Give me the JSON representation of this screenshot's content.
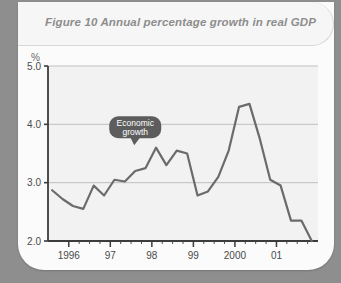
{
  "figure": {
    "title": "Figure 10  Annual percentage growth in real GDP",
    "unit_label": "%",
    "annotation": {
      "line1": "Economic",
      "line2": "growth"
    }
  },
  "colors": {
    "page_background": "#8e8e8e",
    "card_background": "#fbfbfb",
    "title_band": "#f6f6f6",
    "title_text": "#8d8d8d",
    "plot_background": "#f2f2f2",
    "gridline": "#b4b4b4",
    "axis": "#3c3c3c",
    "series_line": "#6b6b6b",
    "callout_fill": "#5d5d5d",
    "callout_text": "#ffffff",
    "tick_text": "#4a4a4a"
  },
  "chart_data": {
    "type": "line",
    "title": "Figure 10  Annual percentage growth in real GDP",
    "xlabel": "",
    "ylabel": "%",
    "ylim": [
      2.0,
      5.0
    ],
    "ytick_labels": [
      "2.0",
      "3.0",
      "4.0",
      "5.0"
    ],
    "ytick_values": [
      2.0,
      3.0,
      4.0,
      5.0
    ],
    "xtick_labels": [
      "1996",
      "97",
      "98",
      "99",
      "2000",
      "01"
    ],
    "xtick_values": [
      1996,
      1997,
      1998,
      1999,
      2000,
      2001
    ],
    "xlim": [
      1995.5,
      2002.0
    ],
    "minor_ticks_per_year": 4,
    "grid": true,
    "legend": false,
    "annotations": [
      {
        "text": "Economic growth",
        "x": 1997.6,
        "y": 3.95,
        "style": "speech-bubble"
      }
    ],
    "series": [
      {
        "name": "Annual percentage growth in real GDP",
        "x": [
          1995.6,
          1995.85,
          1996.1,
          1996.35,
          1996.6,
          1996.85,
          1997.1,
          1997.35,
          1997.6,
          1997.85,
          1998.1,
          1998.35,
          1998.6,
          1998.85,
          1999.1,
          1999.35,
          1999.6,
          1999.85,
          2000.1,
          2000.35,
          2000.6,
          2000.85,
          2001.1,
          2001.35,
          2001.6,
          2001.85
        ],
        "values": [
          2.87,
          2.72,
          2.6,
          2.55,
          2.95,
          2.78,
          3.05,
          3.02,
          3.2,
          3.25,
          3.6,
          3.3,
          3.55,
          3.5,
          2.78,
          2.85,
          3.1,
          3.55,
          4.3,
          4.35,
          3.75,
          3.05,
          2.95,
          2.35,
          2.35,
          2.0
        ]
      }
    ]
  }
}
